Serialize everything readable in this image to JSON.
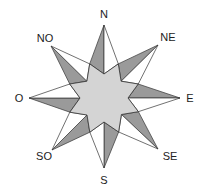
{
  "diagram": {
    "center": [
      104,
      98
    ],
    "colors": {
      "background": "#ffffff",
      "stroke": "#333333",
      "ray_dark": "#9a9a9a",
      "ray_light": "#ffffff",
      "inner_star": "#d4d4d4"
    },
    "directions": [
      {
        "key": "N",
        "label": "N",
        "tip": [
          104,
          25
        ],
        "label_pos": [
          104,
          14
        ]
      },
      {
        "key": "NE",
        "label": "NE",
        "tip": [
          158,
          45
        ],
        "label_pos": [
          168,
          37
        ]
      },
      {
        "key": "E",
        "label": "E",
        "tip": [
          180,
          98
        ],
        "label_pos": [
          190,
          98
        ]
      },
      {
        "key": "SE",
        "label": "SE",
        "tip": [
          158,
          149
        ],
        "label_pos": [
          170,
          156
        ]
      },
      {
        "key": "S",
        "label": "S",
        "tip": [
          104,
          168
        ],
        "label_pos": [
          104,
          180
        ]
      },
      {
        "key": "SO",
        "label": "SO",
        "tip": [
          52,
          150
        ],
        "label_pos": [
          44,
          156
        ]
      },
      {
        "key": "O",
        "label": "O",
        "tip": [
          29,
          98
        ],
        "label_pos": [
          19,
          98
        ]
      },
      {
        "key": "NO",
        "label": "NO",
        "tip": [
          51,
          46
        ],
        "label_pos": [
          45,
          38
        ]
      }
    ]
  }
}
